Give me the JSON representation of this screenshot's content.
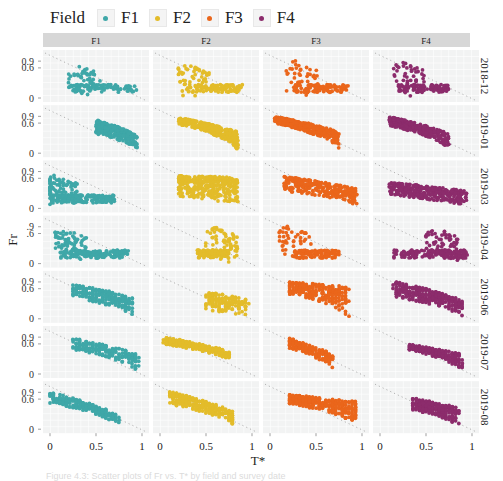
{
  "legend": {
    "title": "Field",
    "items": [
      {
        "label": "F1",
        "color": "#3fa7a8"
      },
      {
        "label": "F2",
        "color": "#e3bc2a"
      },
      {
        "label": "F3",
        "color": "#ea661b"
      },
      {
        "label": "F4",
        "color": "#8c2c6c"
      }
    ]
  },
  "chart_data": {
    "type": "scatter",
    "layout": "facet_grid",
    "xlabel": "T*",
    "ylabel": "Fr",
    "facet_columns": [
      "F1",
      "F2",
      "F3",
      "F4"
    ],
    "facet_rows": [
      "2018-12",
      "2019-01",
      "2019-03",
      "2019-04",
      "2019-06",
      "2019-07",
      "2019-08"
    ],
    "x_ticks": [
      "0",
      "0.5",
      "1"
    ],
    "y_ticks_by_row": [
      [
        "0.9",
        "0.6",
        "0"
      ],
      [
        "0.9",
        "0.6",
        "0"
      ],
      [
        "0.9",
        "0.6",
        "0"
      ],
      [
        ".9",
        ".6",
        "0"
      ],
      [
        "0.9",
        "0.6",
        "0"
      ],
      [
        "0.9",
        "0.6",
        "0"
      ],
      [
        "0.9",
        "0.6",
        "0"
      ]
    ],
    "xlim": [
      0,
      1
    ],
    "ylim": [
      0,
      1
    ],
    "reference_line": {
      "style": "dotted",
      "from": [
        0,
        1
      ],
      "to": [
        1,
        0
      ]
    },
    "grid": true,
    "legend_position": "top",
    "panels": [
      {
        "row": "2018-12",
        "col": "F1",
        "shape": "L",
        "x": [
          0.2,
          0.95
        ],
        "y_base": 0.02,
        "y_peak": 0.7,
        "peak_x": 0.3,
        "n": 140
      },
      {
        "row": "2018-12",
        "col": "F2",
        "shape": "L",
        "x": [
          0.3,
          0.9
        ],
        "y_base": 0.02,
        "y_peak": 0.75,
        "peak_x": 0.3,
        "n": 150
      },
      {
        "row": "2018-12",
        "col": "F3",
        "shape": "L",
        "x": [
          0.25,
          0.85
        ],
        "y_base": 0.02,
        "y_peak": 0.95,
        "peak_x": 0.28,
        "n": 140
      },
      {
        "row": "2018-12",
        "col": "F4",
        "shape": "L",
        "x": [
          0.2,
          0.75
        ],
        "y_base": 0.02,
        "y_peak": 0.85,
        "peak_x": 0.25,
        "n": 150
      },
      {
        "row": "2019-01",
        "col": "F1",
        "shape": "band",
        "x": [
          0.5,
          0.95
        ],
        "y_top": [
          0.75,
          0.2
        ],
        "y_bot": [
          0.25,
          0.0
        ],
        "n": 260
      },
      {
        "row": "2019-01",
        "col": "F2",
        "shape": "band",
        "x": [
          0.2,
          0.85
        ],
        "y_top": [
          0.85,
          0.3
        ],
        "y_bot": [
          0.55,
          0.0
        ],
        "n": 320
      },
      {
        "row": "2019-01",
        "col": "F3",
        "shape": "band",
        "x": [
          0.05,
          0.75
        ],
        "y_top": [
          0.9,
          0.3
        ],
        "y_bot": [
          0.6,
          0.0
        ],
        "n": 320
      },
      {
        "row": "2019-01",
        "col": "F4",
        "shape": "band",
        "x": [
          0.1,
          0.75
        ],
        "y_top": [
          0.9,
          0.25
        ],
        "y_bot": [
          0.5,
          0.0
        ],
        "n": 280
      },
      {
        "row": "2019-03",
        "col": "F1",
        "shape": "L",
        "x": [
          0.0,
          0.7
        ],
        "y_base": 0.02,
        "y_peak": 0.75,
        "peak_x": 0.05,
        "n": 260
      },
      {
        "row": "2019-03",
        "col": "F2",
        "shape": "band",
        "x": [
          0.2,
          0.85
        ],
        "y_top": [
          0.7,
          0.65
        ],
        "y_bot": [
          0.1,
          0.0
        ],
        "n": 340
      },
      {
        "row": "2019-03",
        "col": "F3",
        "shape": "band",
        "x": [
          0.15,
          0.95
        ],
        "y_top": [
          0.7,
          0.25
        ],
        "y_bot": [
          0.2,
          0.0
        ],
        "n": 280
      },
      {
        "row": "2019-03",
        "col": "F4",
        "shape": "band",
        "x": [
          0.1,
          0.95
        ],
        "y_top": [
          0.45,
          0.2
        ],
        "y_bot": [
          0.1,
          0.0
        ],
        "n": 320
      },
      {
        "row": "2019-04",
        "col": "F1",
        "shape": "L",
        "x": [
          0.1,
          0.85
        ],
        "y_base": 0.02,
        "y_peak": 0.8,
        "peak_x": 0.15,
        "n": 240
      },
      {
        "row": "2019-04",
        "col": "F2",
        "shape": "L",
        "x": [
          0.4,
          0.75
        ],
        "y_base": 0.02,
        "y_peak": 0.9,
        "peak_x": 0.6,
        "n": 200
      },
      {
        "row": "2019-04",
        "col": "F3",
        "shape": "L",
        "x": [
          0.25,
          0.75
        ],
        "y_base": 0.02,
        "y_peak": 0.95,
        "peak_x": 0.2,
        "n": 160
      },
      {
        "row": "2019-04",
        "col": "F4",
        "shape": "L",
        "x": [
          0.15,
          0.95
        ],
        "y_base": 0.02,
        "y_peak": 0.85,
        "peak_x": 0.6,
        "n": 220
      },
      {
        "row": "2019-06",
        "col": "F1",
        "shape": "stripes",
        "x": [
          0.25,
          0.9
        ],
        "y_top": [
          0.8,
          0.3
        ],
        "y_bot": [
          0.3,
          0.0
        ],
        "n": 220
      },
      {
        "row": "2019-06",
        "col": "F2",
        "shape": "stripes",
        "x": [
          0.5,
          0.95
        ],
        "y_top": [
          0.5,
          0.25
        ],
        "y_bot": [
          0.05,
          0.0
        ],
        "n": 150
      },
      {
        "row": "2019-06",
        "col": "F3",
        "shape": "stripes",
        "x": [
          0.2,
          0.85
        ],
        "y_top": [
          0.9,
          0.7
        ],
        "y_bot": [
          0.4,
          0.0
        ],
        "n": 260
      },
      {
        "row": "2019-06",
        "col": "F4",
        "shape": "stripes",
        "x": [
          0.15,
          0.9
        ],
        "y_top": [
          0.95,
          0.2
        ],
        "y_bot": [
          0.3,
          0.0
        ],
        "n": 300
      },
      {
        "row": "2019-07",
        "col": "F1",
        "shape": "stripes",
        "x": [
          0.25,
          0.95
        ],
        "y_top": [
          0.85,
          0.25
        ],
        "y_bot": [
          0.4,
          0.0
        ],
        "n": 200
      },
      {
        "row": "2019-07",
        "col": "F2",
        "shape": "stripes",
        "x": [
          0.05,
          0.75
        ],
        "y_top": [
          0.9,
          0.35
        ],
        "y_bot": [
          0.6,
          0.15
        ],
        "n": 260
      },
      {
        "row": "2019-07",
        "col": "F3",
        "shape": "stripes",
        "x": [
          0.2,
          0.7
        ],
        "y_top": [
          0.85,
          0.2
        ],
        "y_bot": [
          0.45,
          0.0
        ],
        "n": 180
      },
      {
        "row": "2019-07",
        "col": "F4",
        "shape": "stripes",
        "x": [
          0.3,
          0.9
        ],
        "y_top": [
          0.6,
          0.25
        ],
        "y_bot": [
          0.4,
          0.0
        ],
        "n": 200
      },
      {
        "row": "2019-08",
        "col": "F1",
        "shape": "stripes",
        "x": [
          0.0,
          0.75
        ],
        "y_top": [
          0.9,
          0.1
        ],
        "y_bot": [
          0.45,
          0.0
        ],
        "n": 240
      },
      {
        "row": "2019-08",
        "col": "F2",
        "shape": "stripes",
        "x": [
          0.1,
          0.8
        ],
        "y_top": [
          0.95,
          0.2
        ],
        "y_bot": [
          0.4,
          0.0
        ],
        "n": 260
      },
      {
        "row": "2019-08",
        "col": "F3",
        "shape": "stripes",
        "x": [
          0.2,
          0.95
        ],
        "y_top": [
          0.8,
          0.5
        ],
        "y_bot": [
          0.45,
          0.0
        ],
        "n": 320
      },
      {
        "row": "2019-08",
        "col": "F4",
        "shape": "stripes",
        "x": [
          0.35,
          0.85
        ],
        "y_top": [
          0.65,
          0.3
        ],
        "y_bot": [
          0.25,
          0.0
        ],
        "n": 220
      }
    ]
  },
  "caption": "Figure 4.3: Scatter plots of Fr vs. T* by field and survey date"
}
